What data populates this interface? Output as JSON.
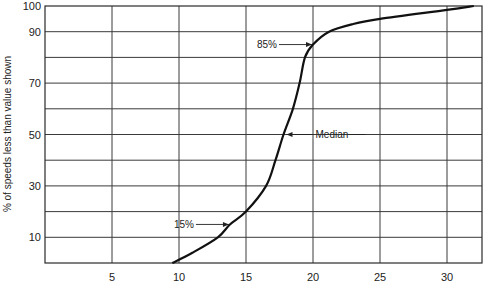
{
  "chart_data": {
    "type": "line",
    "title": "",
    "xlabel": "",
    "ylabel": "% of speeds less than value shown",
    "xlim": [
      0,
      32.5
    ],
    "ylim": [
      0,
      100
    ],
    "x_ticks": [
      5,
      10,
      15,
      20,
      25,
      30
    ],
    "y_ticks": [
      10,
      30,
      50,
      70,
      90,
      100
    ],
    "x_gridlines": [
      5,
      10,
      15,
      20,
      25,
      30
    ],
    "y_gridlines": [
      10,
      20,
      30,
      40,
      50,
      60,
      70,
      80,
      90
    ],
    "grid": true,
    "legend": null,
    "series": [
      {
        "name": "Cumulative speed distribution",
        "x": [
          9.5,
          11.0,
          12.9,
          13.8,
          15.0,
          16.5,
          17.2,
          17.8,
          18.5,
          19.0,
          19.4,
          20.0,
          21.2,
          23.0,
          25.0,
          30.0,
          32.0
        ],
        "y": [
          0,
          4,
          10,
          15,
          20,
          30,
          40,
          50,
          60,
          70,
          80,
          85,
          90,
          93,
          95,
          98.5,
          100
        ]
      }
    ],
    "annotations": [
      {
        "text": "85%",
        "x": 20.0,
        "y": 85,
        "arrow": "right"
      },
      {
        "text": "Median",
        "x": 17.8,
        "y": 50,
        "arrow": "left"
      },
      {
        "text": "15%",
        "x": 13.8,
        "y": 15,
        "arrow": "right"
      }
    ]
  }
}
